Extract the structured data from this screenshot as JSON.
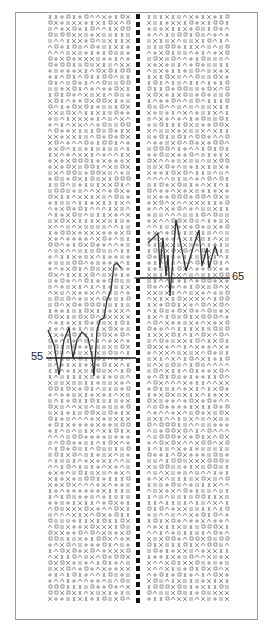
{
  "sheet": {
    "type": "glyph-grid-test-sheet",
    "columns": 2,
    "grid_rows_per_column": 98,
    "grid_cols_per_column": 14
  },
  "graphs": {
    "left": {
      "baseline_label": "55",
      "baseline_y": 358,
      "points": [
        [
          48,
          330
        ],
        [
          54,
          345
        ],
        [
          59,
          375
        ],
        [
          64,
          340
        ],
        [
          69,
          328
        ],
        [
          73,
          358
        ],
        [
          77,
          340
        ],
        [
          82,
          332
        ],
        [
          88,
          338
        ],
        [
          92,
          356
        ],
        [
          94,
          376
        ],
        [
          97,
          330
        ],
        [
          100,
          320
        ],
        [
          104,
          318
        ],
        [
          107,
          300
        ],
        [
          111,
          290
        ],
        [
          114,
          265
        ],
        [
          117,
          263
        ],
        [
          121,
          268
        ]
      ]
    },
    "right": {
      "baseline_label": "65",
      "baseline_y": 278,
      "points": [
        [
          148,
          243
        ],
        [
          158,
          233
        ],
        [
          160,
          268
        ],
        [
          163,
          238
        ],
        [
          166,
          276
        ],
        [
          168,
          255
        ],
        [
          170,
          296
        ],
        [
          176,
          220
        ],
        [
          180,
          240
        ],
        [
          186,
          271
        ],
        [
          193,
          248
        ],
        [
          199,
          230
        ],
        [
          202,
          266
        ],
        [
          207,
          248
        ],
        [
          209,
          268
        ],
        [
          215,
          246
        ],
        [
          218,
          256
        ]
      ]
    }
  },
  "colors": {
    "ink": "#222222",
    "glyph": "#8a8a8a",
    "border": "#9a9a9a",
    "background": "#ffffff"
  }
}
